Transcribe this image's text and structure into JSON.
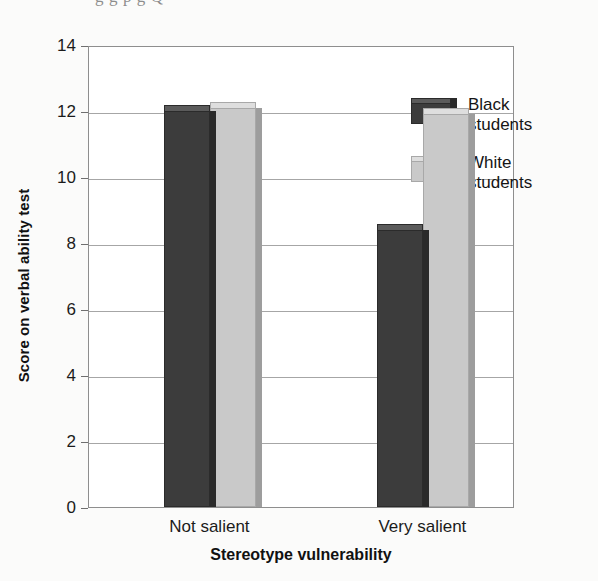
{
  "page": {
    "ghost_text_top": "g      g      p           g  Q",
    "ghost_text_faint": "                                                  "
  },
  "chart_data": {
    "type": "bar",
    "title": "",
    "xlabel": "Stereotype vulnerability",
    "ylabel": "Score on verbal ability test",
    "categories": [
      "Not salient",
      "Very salient"
    ],
    "series": [
      {
        "name": "Black\nstudents",
        "color": "#3c3c3c",
        "values": [
          12.0,
          8.4
        ]
      },
      {
        "name": "White\nstudents",
        "color": "#c9c9c9",
        "values": [
          12.1,
          11.9
        ]
      }
    ],
    "ylim": [
      0,
      14
    ],
    "yticks": [
      0,
      2,
      4,
      6,
      8,
      10,
      12,
      14
    ],
    "ytick_labels": [
      "0",
      "2",
      "4",
      "6",
      "8",
      "10",
      "12",
      "14"
    ],
    "grid": true,
    "legend_position": "top-right",
    "legend_entries": [
      "Black\nstudents",
      "White\nstudents"
    ]
  }
}
